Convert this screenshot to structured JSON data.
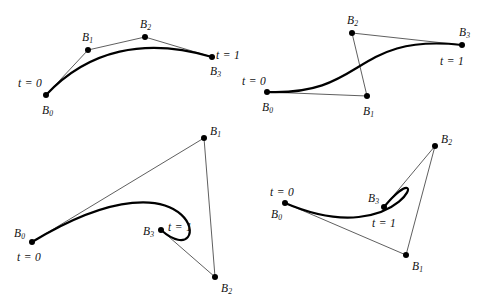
{
  "figure": {
    "stroke_curve": "#000000",
    "stroke_hull": "#1a1a1a",
    "point_fill": "#000000",
    "background": "#ffffff",
    "curve_width": 2.2,
    "hull_width": 0.7,
    "point_radius": 3.0
  },
  "chart_data": {
    "type": "line",
    "xlabel": "",
    "ylabel": "",
    "xlim": [
      0,
      491
    ],
    "ylim": [
      0,
      294
    ],
    "grid": false,
    "legend": "none",
    "panels": [
      {
        "name": "top-left",
        "control_points": [
          {
            "label": "B",
            "sub": "0",
            "x": 46,
            "y": 95
          },
          {
            "label": "B",
            "sub": "1",
            "x": 88,
            "y": 50
          },
          {
            "label": "B",
            "sub": "2",
            "x": 145,
            "y": 37
          },
          {
            "label": "B",
            "sub": "3",
            "x": 212,
            "y": 57
          }
        ],
        "hull_segments": [
          [
            0,
            1
          ],
          [
            1,
            2
          ],
          [
            2,
            3
          ]
        ],
        "annotations": [
          {
            "text": "t = 0",
            "x": 18,
            "y": 78
          },
          {
            "text": "t = 1",
            "x": 216,
            "y": 50
          }
        ],
        "point_label_offsets": [
          {
            "dx": -4,
            "dy": 10
          },
          {
            "dx": -6,
            "dy": -18
          },
          {
            "dx": -5,
            "dy": -18
          },
          {
            "dx": -2,
            "dy": 9
          }
        ]
      },
      {
        "name": "top-right",
        "control_points": [
          {
            "label": "B",
            "sub": "0",
            "x": 267,
            "y": 92
          },
          {
            "label": "B",
            "sub": "1",
            "x": 367,
            "y": 96
          },
          {
            "label": "B",
            "sub": "2",
            "x": 352,
            "y": 33
          },
          {
            "label": "B",
            "sub": "3",
            "x": 462,
            "y": 45
          }
        ],
        "hull_segments": [
          [
            0,
            1
          ],
          [
            1,
            2
          ],
          [
            2,
            3
          ]
        ],
        "annotations": [
          {
            "text": "t = 0",
            "x": 242,
            "y": 76
          },
          {
            "text": "t = 1",
            "x": 440,
            "y": 56
          }
        ],
        "point_label_offsets": [
          {
            "dx": -5,
            "dy": 10
          },
          {
            "dx": -4,
            "dy": 10
          },
          {
            "dx": -5,
            "dy": -18
          },
          {
            "dx": -3,
            "dy": -18
          }
        ]
      },
      {
        "name": "bottom-left",
        "control_points": [
          {
            "label": "B",
            "sub": "0",
            "x": 32,
            "y": 242
          },
          {
            "label": "B",
            "sub": "1",
            "x": 204,
            "y": 138
          },
          {
            "label": "B",
            "sub": "2",
            "x": 215,
            "y": 277
          },
          {
            "label": "B",
            "sub": "3",
            "x": 161,
            "y": 230
          }
        ],
        "hull_segments": [
          [
            0,
            1
          ],
          [
            1,
            2
          ],
          [
            2,
            3
          ]
        ],
        "annotations": [
          {
            "text": "t = 0",
            "x": 17,
            "y": 252
          },
          {
            "text": "t = 1",
            "x": 168,
            "y": 222
          }
        ],
        "point_label_offsets": [
          {
            "dx": -18,
            "dy": -14
          },
          {
            "dx": 6,
            "dy": -12
          },
          {
            "dx": 6,
            "dy": 6
          },
          {
            "dx": -18,
            "dy": -4
          }
        ]
      },
      {
        "name": "bottom-right",
        "control_points": [
          {
            "label": "B",
            "sub": "0",
            "x": 285,
            "y": 203
          },
          {
            "label": "B",
            "sub": "1",
            "x": 406,
            "y": 255
          },
          {
            "label": "B",
            "sub": "2",
            "x": 435,
            "y": 146
          },
          {
            "label": "B",
            "sub": "3",
            "x": 384,
            "y": 207
          }
        ],
        "hull_segments": [
          [
            0,
            1
          ],
          [
            1,
            2
          ],
          [
            2,
            3
          ]
        ],
        "annotations": [
          {
            "text": "t = 0",
            "x": 270,
            "y": 187
          },
          {
            "text": "t = 1",
            "x": 372,
            "y": 218
          }
        ],
        "point_label_offsets": [
          {
            "dx": -14,
            "dy": 6
          },
          {
            "dx": 6,
            "dy": 6
          },
          {
            "dx": 6,
            "dy": -12
          },
          {
            "dx": -16,
            "dy": -14
          }
        ]
      }
    ]
  }
}
